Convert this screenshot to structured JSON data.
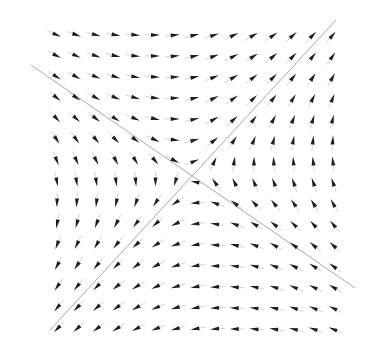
{
  "diagram": {
    "type": "direction-field",
    "background": "#ffffff",
    "arrow_color": "#1e1e1e",
    "line_color": "#a8a8a8",
    "grid": {
      "cols": 15,
      "rows": 15,
      "x0": 57,
      "y0": 35,
      "dx": 19.7,
      "dy": 21.0
    },
    "center": [
      191,
      175
    ],
    "eigenlines": [
      {
        "name": "stable-line",
        "from": [
          31,
          65
        ],
        "to": [
          355,
          288
        ],
        "behavior": "inward"
      },
      {
        "name": "unstable-line",
        "from": [
          50,
          330
        ],
        "to": [
          336,
          20
        ],
        "behavior": "outward"
      }
    ],
    "arrow_length": 9,
    "arrow_width": 4
  }
}
